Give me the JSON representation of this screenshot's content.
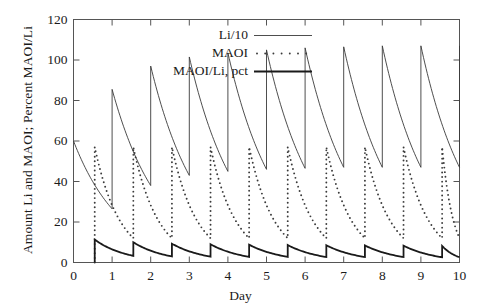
{
  "chart_data": {
    "type": "line",
    "title": "",
    "xlabel": "Day",
    "ylabel": "Amount Li and MAOI; Percent MAOI/Li",
    "xlim": [
      0,
      10
    ],
    "ylim": [
      0,
      120
    ],
    "xticks": [
      "0",
      "1",
      "2",
      "3",
      "4",
      "5",
      "6",
      "7",
      "8",
      "9",
      "10"
    ],
    "yticks": [
      "0",
      "20",
      "40",
      "60",
      "80",
      "100",
      "120"
    ],
    "grid": false,
    "legend_position": "top-center",
    "dose_interval_days": 0.5,
    "first_dose_day": 0.5,
    "series": [
      {
        "name": "Li/10",
        "style": "solid",
        "color": "#3a3a3a",
        "width": 0.9,
        "description": "Lithium amount divided by 10; sawtooth accumulating to steady state, peaks rise from 60 to about 107, troughs about 47",
        "peaks": [
          60.0,
          85.5,
          97.0,
          101.5,
          103.5,
          105.0,
          106.0,
          106.5,
          107.0,
          107.0,
          107.0
        ],
        "troughs": [
          26.5,
          38.0,
          43.0,
          45.0,
          46.0,
          46.5,
          47.0,
          47.0,
          47.0,
          47.0,
          47.0
        ],
        "x_peaks": [
          0.0,
          1.0,
          2.0,
          3.0,
          4.0,
          5.0,
          6.0,
          7.0,
          8.0,
          9.0,
          10.0
        ],
        "elimination_halflife_days": 0.8
      },
      {
        "name": "MAOI",
        "style": "dotted",
        "color": "#3a3a3a",
        "width": 1.0,
        "description": "MAOI amount; dotted sawtooth, peaks about 57, troughs about 12",
        "peaks": [
          57.0,
          57.0,
          57.0,
          57.0,
          57.0,
          57.0,
          57.0,
          57.0,
          57.0,
          57.0
        ],
        "troughs": [
          12.0,
          12.0,
          12.0,
          12.0,
          12.0,
          12.0,
          12.0,
          12.0,
          12.0,
          12.0
        ],
        "x_peaks": [
          0.55,
          1.55,
          2.55,
          3.55,
          4.55,
          5.55,
          6.55,
          7.55,
          8.55,
          9.55
        ],
        "elimination_halflife_days": 0.42
      },
      {
        "name": "MAOI/Li, pct",
        "style": "solid-thick",
        "color": "#1a1a1a",
        "width": 1.8,
        "description": "Percent ratio MAOI over Li; low sawtooth near the axis, peaks about 11 early declining to about 8, troughs about 3",
        "peaks": [
          11.3,
          10.0,
          9.3,
          9.0,
          8.8,
          8.6,
          8.5,
          8.4,
          8.3,
          8.2
        ],
        "troughs": [
          3.3,
          3.0,
          2.9,
          2.8,
          2.8,
          2.7,
          2.7,
          2.7,
          2.6,
          2.6
        ],
        "x_peaks": [
          0.55,
          1.55,
          2.55,
          3.55,
          4.55,
          5.55,
          6.55,
          7.55,
          8.55,
          9.55
        ]
      }
    ],
    "legend": [
      {
        "label": "Li/10",
        "style": "solid"
      },
      {
        "label": "MAOI",
        "style": "dotted"
      },
      {
        "label": "MAOI/Li, pct",
        "style": "solid-thick"
      }
    ]
  },
  "axis": {
    "x_label": "Day",
    "y_label": "Amount Li and MAOI; Percent MAOI/Li"
  }
}
